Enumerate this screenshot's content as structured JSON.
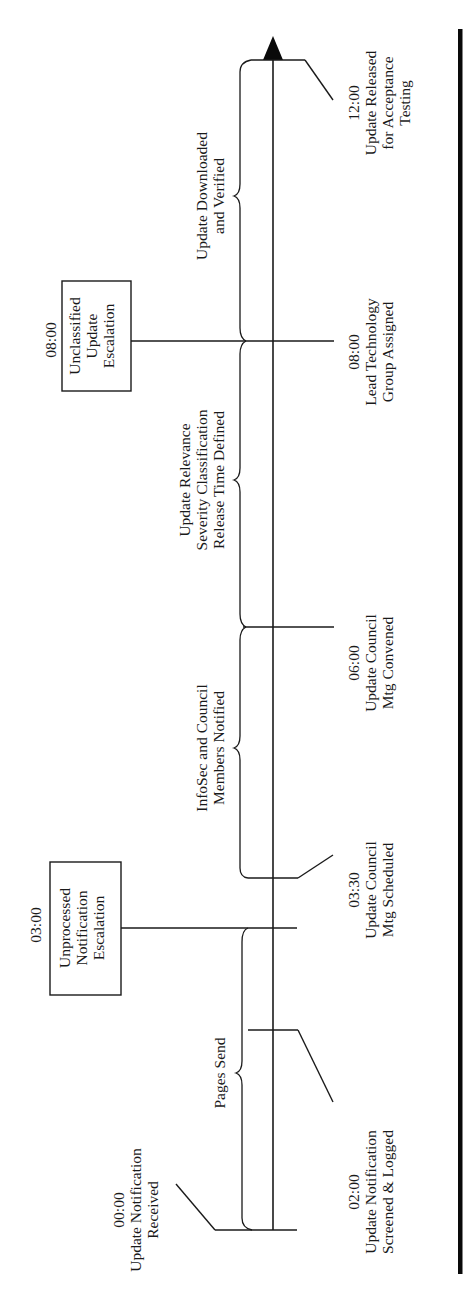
{
  "diagram": {
    "orientation": "rotated 90deg counter-clockwise",
    "colors": {
      "ink": "#1a1a1a",
      "background": "#ffffff",
      "rule": "#0a0a0a"
    },
    "events_below": [
      {
        "id": "e0000",
        "time": "00:00",
        "lines": [
          "Update Notification",
          "Received"
        ]
      },
      {
        "id": "e0200",
        "time": "02:00",
        "lines": [
          "Update Notification",
          "Screened & Logged"
        ]
      },
      {
        "id": "e0330",
        "time": "03:30",
        "lines": [
          "Update Council",
          "Mtg Scheduled"
        ]
      },
      {
        "id": "e0600",
        "time": "06:00",
        "lines": [
          "Update Council",
          "Mtg Convened"
        ]
      },
      {
        "id": "e0800",
        "time": "08:00",
        "lines": [
          "Lead Technology",
          "Group Assigned"
        ]
      },
      {
        "id": "e1200",
        "time": "12:00",
        "lines": [
          "Update Released",
          "for Acceptance",
          "Testing"
        ]
      }
    ],
    "escalations": [
      {
        "id": "esc0300",
        "time": "03:00",
        "lines": [
          "Unprocessed",
          "Notification",
          "Escalation"
        ]
      },
      {
        "id": "esc0800",
        "time": "08:00",
        "lines": [
          "Unclassified",
          "Update",
          "Escalation"
        ]
      }
    ],
    "phases": [
      {
        "id": "p1",
        "lines": [
          "Pages Send"
        ]
      },
      {
        "id": "p2",
        "lines": [
          "InfoSec and Council",
          "Members Notified"
        ]
      },
      {
        "id": "p3",
        "lines": [
          "Update Relevance",
          "Severity Classification",
          "Release Time Defined"
        ]
      },
      {
        "id": "p4",
        "lines": [
          "Update Downloaded",
          "and Verified"
        ]
      }
    ]
  }
}
